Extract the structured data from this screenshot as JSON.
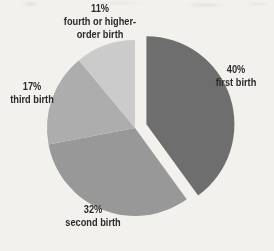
{
  "chart_data": {
    "type": "pie",
    "title": "",
    "unit": "%",
    "direction": "clockwise",
    "start_angle_deg": 0,
    "explode_offset_px": 12,
    "legend": "none",
    "labels_position": "outside",
    "background_color": "#f2f1ee",
    "text_color": "#2a2a2a",
    "slices": [
      {
        "label": "first birth",
        "pct_label": "40%",
        "value": 40,
        "color": "#6e6e6e",
        "exploded": true,
        "label_lines": [
          "first birth"
        ]
      },
      {
        "label": "second birth",
        "pct_label": "32%",
        "value": 32,
        "color": "#989898",
        "exploded": false,
        "label_lines": [
          "second birth"
        ]
      },
      {
        "label": "third birth",
        "pct_label": "17%",
        "value": 17,
        "color": "#adadad",
        "exploded": false,
        "label_lines": [
          "third birth"
        ]
      },
      {
        "label": "fourth or higher-order birth",
        "pct_label": "11%",
        "value": 11,
        "color": "#cbcbcb",
        "exploded": false,
        "label_lines": [
          "fourth or higher-",
          "order birth"
        ]
      }
    ]
  }
}
